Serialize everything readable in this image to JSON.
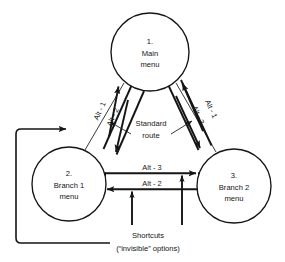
{
  "diagram": {
    "nodes": [
      {
        "id": "main",
        "number": "1.",
        "line1": "Main",
        "line2": "menu",
        "cx": 150,
        "cy": 52,
        "r": 39
      },
      {
        "id": "branch1",
        "number": "2.",
        "line1": "Branch 1",
        "line2": "menu",
        "cx": 69,
        "cy": 184,
        "r": 37
      },
      {
        "id": "branch2",
        "number": "3.",
        "line1": "Branch 2",
        "line2": "menu",
        "cx": 234,
        "cy": 186,
        "r": 37
      }
    ],
    "edge_labels": {
      "left_outbound": "Alt - 1",
      "left_inbound": "Alt - 2",
      "right_outbound": "Alt - 1",
      "right_inbound": "Alt - 3",
      "horizontal_top": "Alt - 3",
      "horizontal_bottom": "Alt - 2"
    },
    "annotations": {
      "standard_route_line1": "Standard",
      "standard_route_line2": "route",
      "shortcuts_line1": "Shortcuts",
      "shortcuts_line2": "(“invisible” options)"
    },
    "colors": {
      "ink": "#151515",
      "paper": "#ffffff"
    }
  }
}
